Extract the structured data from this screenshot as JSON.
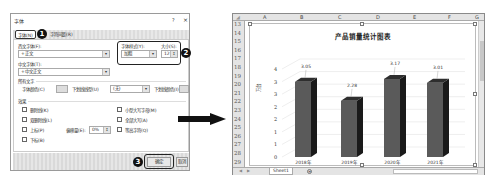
{
  "dialog": {
    "title": "字体",
    "help": "?",
    "close": "×",
    "tabs": [
      {
        "label": "字体(N)",
        "active": true
      },
      {
        "label": "字符间距(R)",
        "active": false
      }
    ],
    "western_font": {
      "label": "西文字体(F):",
      "value": "+正文"
    },
    "font_style": {
      "label": "字体样式(Y):",
      "value": "加粗"
    },
    "font_size": {
      "label": "大小(S):",
      "value": "12"
    },
    "asian_font": {
      "label": "中文字体(T):",
      "value": "+中文正文"
    },
    "all_text": {
      "section_label": "所有文字",
      "font_color_label": "字体颜色(C)",
      "underline_type_label": "下划线线型(U)",
      "underline_type_value": "(无)",
      "underline_color_label": "下划线颜色(I)"
    },
    "effects": {
      "section_label": "效果",
      "left": [
        {
          "label": "删除线(K)",
          "checked": false
        },
        {
          "label": "双删除线(L)",
          "checked": false
        },
        {
          "label": "上标(P)",
          "checked": false
        },
        {
          "label": "下标(B)",
          "checked": false
        }
      ],
      "offset_label": "偏移量(E):",
      "offset_value": "0%",
      "right": [
        {
          "label": "小型大写字母(M)",
          "checked": false
        },
        {
          "label": "全部大写(A)",
          "checked": false
        },
        {
          "label": "等高字符(Q)",
          "checked": false
        }
      ]
    },
    "ok_label": "确定",
    "cancel_label": "取消",
    "step_badges": [
      "1",
      "2",
      "3"
    ]
  },
  "excel": {
    "columns": [
      "A",
      "B",
      "C",
      "D",
      "E",
      "F",
      "G"
    ],
    "rows": [
      "13",
      "14",
      "15",
      "16",
      "17",
      "18",
      "19",
      "20",
      "21",
      "22",
      "23",
      "24",
      "25",
      "26",
      "27",
      "28",
      "29"
    ],
    "sheet_tab": "Sheet1",
    "add_sheet": "+"
  },
  "chart_data": {
    "type": "bar",
    "title": "产品销量统计图表",
    "categories": [
      "2018年",
      "2019年",
      "2020年",
      "2021年"
    ],
    "values": [
      3.05,
      2.28,
      3.17,
      3.01
    ],
    "data_labels": [
      "3.05",
      "2.28",
      "3.17",
      "3.01"
    ],
    "ytick_labels": [
      "0",
      "1",
      "1",
      "2",
      "2",
      "3",
      "3",
      "4"
    ],
    "ylim": [
      0,
      3.5
    ],
    "ylabel": "万台",
    "xlabel": "",
    "grid": true,
    "style": "3d-column",
    "bar_color": "#555555"
  }
}
